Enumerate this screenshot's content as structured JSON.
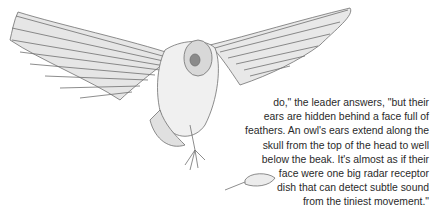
{
  "illustration": {
    "subject": "barn owl in flight with wings spread, talons extended toward a mouse",
    "icon": "owl-illustration",
    "secondary": "mouse-illustration"
  },
  "passage": {
    "lines": [
      "do,\" the leader answers, \"but their",
      "ears are hidden behind a face full of",
      "feathers. An owl's ears extend along the",
      "skull from the top of the head to well",
      "below the beak.  It's almost as if their",
      "face were one big radar receptor",
      "dish that can detect subtle sound",
      "from the tiniest movement.\""
    ]
  },
  "colors": {
    "ink": "#2a2a2a",
    "sketch": "#6e6e6e",
    "paper": "#ffffff"
  }
}
